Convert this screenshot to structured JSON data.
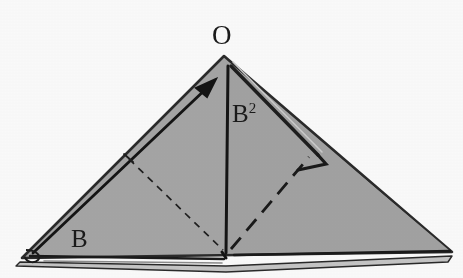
{
  "figure": {
    "kind": "geometry-diagram",
    "background_color": "#ffffff",
    "fill_color": "#a8a8a8",
    "stroke_color": "#1a1a1a",
    "shadow_color": "#bdbdbd"
  },
  "labels": {
    "apex": "O",
    "left_base": "B",
    "median_base": "B",
    "median_exponent": "2"
  },
  "geometry": {
    "apex": {
      "x": 224,
      "y": 56
    },
    "left_vertex": {
      "x": 22,
      "y": 258
    },
    "right_vertex": {
      "x": 452,
      "y": 252
    },
    "base_midpoint": {
      "x": 226,
      "y": 253
    },
    "median_top": {
      "x": 228,
      "y": 66
    },
    "arrow_tail": {
      "x": 30,
      "y": 254
    },
    "arrow_head": {
      "x": 213,
      "y": 83
    },
    "right_angle_corner": {
      "x": 314,
      "y": 160
    },
    "dashed_left_start": {
      "x": 130,
      "y": 160
    },
    "dashed_left_end": {
      "x": 222,
      "y": 250
    },
    "dashed_right_start": {
      "x": 232,
      "y": 248
    },
    "dashed_right_end": {
      "x": 308,
      "y": 158
    }
  },
  "annotations": {
    "angle_arc_vertex": "left-base-angle-arc",
    "right_angle_marker": "right-angle-marker",
    "tick_mark": "left-edge-tick"
  }
}
